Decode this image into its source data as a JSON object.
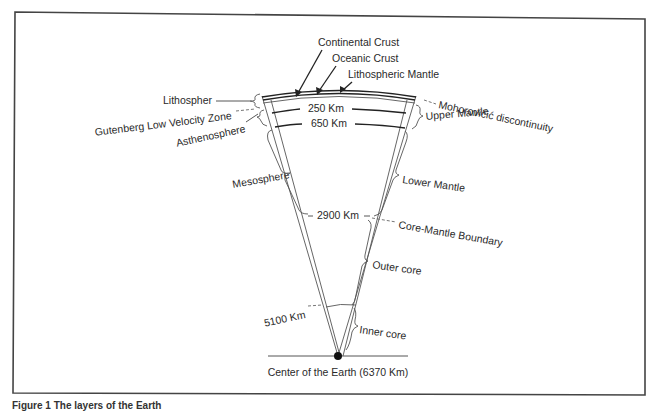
{
  "diagram": {
    "top_labels": {
      "continental_crust": "Continental Crust",
      "oceanic_crust": "Oceanic Crust",
      "lithospheric_mantle": "Lithospheric Mantle"
    },
    "left_labels": {
      "lithosphere": "Lithospher",
      "gutenberg": "Gutenberg Low Velocity Zone",
      "asthenosphere": "Asthenosphere",
      "mesosphere": "Mesosphere"
    },
    "right_labels": {
      "moho": "Mohorovičić discontinuity",
      "upper_mantle": "Upper Mantle",
      "lower_mantle": "Lower Mantle",
      "core_mantle_boundary": "Core-Mantle Boundary",
      "outer_core": "Outer core",
      "inner_core": "Inner core"
    },
    "depths": {
      "d250": "250 Km",
      "d650": "650 Km",
      "d2900": "2900 Km",
      "d5100": "5100 Km"
    },
    "center_label": "Center of the Earth (6370 Km)",
    "caption": "Figure 1 The layers of the Earth"
  }
}
